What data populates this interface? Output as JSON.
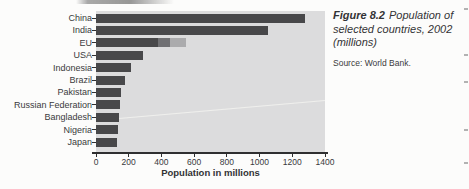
{
  "figure": {
    "label": "Figure 8.2",
    "title": "Population of selected countries, 2002 (millions)",
    "source": "Source: World Bank."
  },
  "chart_data": {
    "type": "bar",
    "orientation": "horizontal",
    "title": "",
    "xlabel": "Population in millions",
    "ylabel": "",
    "xlim": [
      0,
      1400
    ],
    "xticks": [
      0,
      200,
      400,
      600,
      800,
      1000,
      1200,
      1400
    ],
    "grid": false,
    "legend": "none",
    "categories": [
      "China",
      "India",
      "EU",
      "USA",
      "Indonesia",
      "Brazil",
      "Pakistan",
      "Russian Federation",
      "Bangladesh",
      "Nigeria",
      "Japan"
    ],
    "values": [
      1280,
      1050,
      550,
      290,
      212,
      175,
      150,
      145,
      138,
      133,
      127
    ],
    "bars": [
      {
        "label": "China",
        "segments": [
          {
            "value": 1280,
            "color": "#48484a"
          }
        ]
      },
      {
        "label": "India",
        "segments": [
          {
            "value": 1050,
            "color": "#48484a"
          }
        ]
      },
      {
        "label": "EU",
        "segments": [
          {
            "value": 380,
            "color": "#48484a"
          },
          {
            "value": 75,
            "color": "#707073"
          },
          {
            "value": 95,
            "color": "#ababad"
          }
        ]
      },
      {
        "label": "USA",
        "segments": [
          {
            "value": 290,
            "color": "#48484a"
          }
        ]
      },
      {
        "label": "Indonesia",
        "segments": [
          {
            "value": 212,
            "color": "#48484a"
          }
        ]
      },
      {
        "label": "Brazil",
        "segments": [
          {
            "value": 175,
            "color": "#48484a"
          }
        ]
      },
      {
        "label": "Pakistan",
        "segments": [
          {
            "value": 150,
            "color": "#48484a"
          }
        ]
      },
      {
        "label": "Russian Federation",
        "segments": [
          {
            "value": 145,
            "color": "#48484a"
          }
        ]
      },
      {
        "label": "Bangladesh",
        "segments": [
          {
            "value": 138,
            "color": "#48484a"
          }
        ]
      },
      {
        "label": "Nigeria",
        "segments": [
          {
            "value": 133,
            "color": "#48484a"
          }
        ]
      },
      {
        "label": "Japan",
        "segments": [
          {
            "value": 127,
            "color": "#48484a"
          }
        ]
      }
    ]
  },
  "colors": {
    "bar_primary": "#48484a",
    "bar_secondary": "#707073",
    "bar_tertiary": "#ababad",
    "plot_background": "#dcdcdd",
    "axis": "#2f2f30",
    "text": "#3a3a3c",
    "page_background": "#fcfcfb"
  }
}
